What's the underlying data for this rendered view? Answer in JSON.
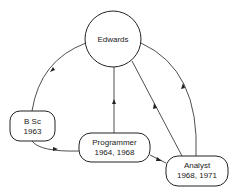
{
  "diagram": {
    "nodes": [
      {
        "id": "edwards",
        "label": "Edwards",
        "shape": "circle"
      },
      {
        "id": "bsc",
        "label_line1": "B Sc",
        "label_line2": "1963",
        "shape": "rounded-rect"
      },
      {
        "id": "programmer",
        "label_line1": "Programmer",
        "label_line2": "1964, 1968",
        "shape": "rounded-rect"
      },
      {
        "id": "analyst",
        "label_line1": "Analyst",
        "label_line2": "1968, 1971",
        "shape": "rounded-rect"
      }
    ],
    "edges": [
      {
        "from": "edwards",
        "to": "bsc"
      },
      {
        "from": "bsc",
        "to": "programmer"
      },
      {
        "from": "programmer",
        "to": "edwards"
      },
      {
        "from": "programmer",
        "to": "analyst"
      },
      {
        "from": "analyst",
        "to": "edwards",
        "count": 2
      }
    ]
  }
}
